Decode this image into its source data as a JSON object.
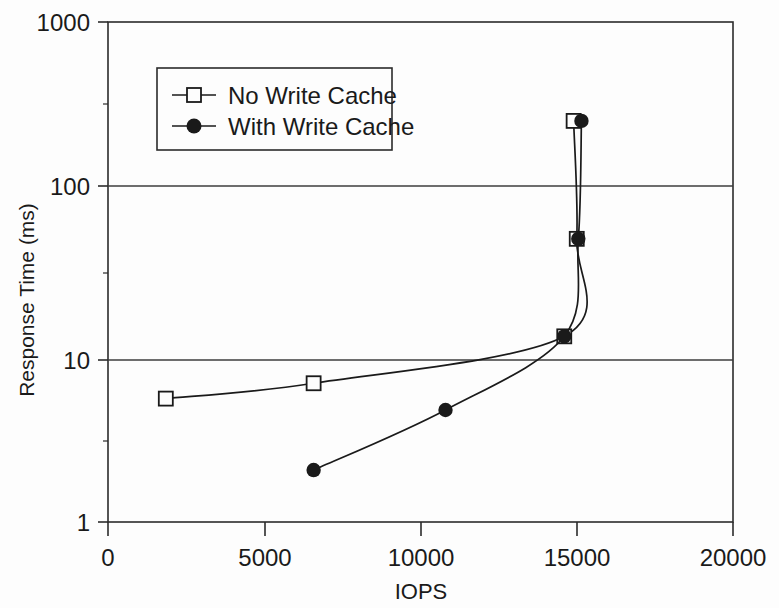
{
  "chart_data": {
    "type": "line",
    "title": "",
    "xlabel": "IOPS",
    "ylabel": "Response Time (ms)",
    "xlim": [
      0,
      20000
    ],
    "ylim": [
      1,
      1000
    ],
    "yscale": "log",
    "xscale": "linear",
    "grid": "horizontal-major-only",
    "legend_position": "upper-left-inside",
    "xticks": [
      0,
      5000,
      10000,
      15000,
      20000
    ],
    "xtick_labels": [
      "0",
      "5000",
      "10000",
      "15000",
      "20000"
    ],
    "yticks": [
      1,
      10,
      100,
      1000
    ],
    "ytick_labels": [
      "1",
      "10",
      "100",
      "1000"
    ],
    "series": [
      {
        "name": "No Write Cache",
        "marker": "open-square",
        "color": "#1a1a1a",
        "x": [
          1850,
          6580,
          14600,
          15000,
          14900
        ],
        "y": [
          5.5,
          6.8,
          13.0,
          50.0,
          255.0
        ]
      },
      {
        "name": "With Write Cache",
        "marker": "filled-circle",
        "color": "#1a1a1a",
        "x": [
          6580,
          10800,
          14600,
          15050,
          15150
        ],
        "y": [
          2.05,
          4.7,
          13.0,
          50.0,
          255.0
        ]
      }
    ]
  },
  "legend": {
    "entries": [
      {
        "label": "No Write Cache",
        "marker": "open-square"
      },
      {
        "label": "With Write Cache",
        "marker": "filled-circle"
      }
    ]
  },
  "axes": {
    "x_title": "IOPS",
    "y_title": "Response Time (ms)",
    "x_tick_0": "0",
    "x_tick_1": "5000",
    "x_tick_2": "10000",
    "x_tick_3": "15000",
    "x_tick_4": "20000",
    "y_tick_0": "1",
    "y_tick_1": "10",
    "y_tick_2": "100",
    "y_tick_3": "1000"
  },
  "style": {
    "background": "#fdfdfd",
    "ink": "#1a1a1a",
    "grid": "#4a4a4a"
  }
}
